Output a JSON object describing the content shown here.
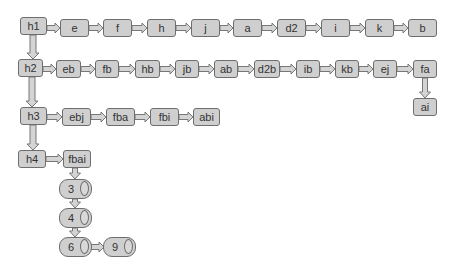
{
  "diagram": {
    "type": "linked-list-of-lists",
    "rows": [
      {
        "head": "h1",
        "items": [
          "e",
          "f",
          "h",
          "j",
          "a",
          "d2",
          "i",
          "k",
          "b"
        ]
      },
      {
        "head": "h2",
        "items": [
          "eb",
          "fb",
          "hb",
          "jb",
          "ab",
          "d2b",
          "ib",
          "kb",
          "ej",
          "fa"
        ],
        "branch": {
          "from": "fa",
          "to": "ai"
        }
      },
      {
        "head": "h3",
        "items": [
          "ebj",
          "fba",
          "fbi",
          "abi"
        ]
      },
      {
        "head": "h4",
        "items": [
          "fbai"
        ],
        "chain": [
          "3",
          "4",
          "6"
        ],
        "chain_branch": {
          "from": "6",
          "to": "9"
        }
      }
    ],
    "colors": {
      "node_fill": "#cfcfcf",
      "node_border": "#6e6e6e",
      "arrow_fill": "#d4d4d4",
      "arrow_border": "#777777",
      "text": "#333333"
    }
  }
}
